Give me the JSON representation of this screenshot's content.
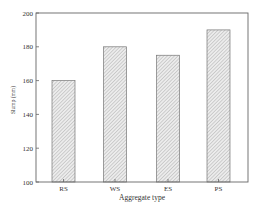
{
  "chart_data": {
    "type": "bar",
    "title": "",
    "xlabel": "Aggregate type",
    "ylabel": "Slump (mm)",
    "categories": [
      "RS",
      "WS",
      "ES",
      "PS"
    ],
    "values": [
      160,
      180,
      175,
      190
    ],
    "ylim": [
      100,
      200
    ],
    "yticks": [
      100,
      120,
      140,
      160,
      180,
      200
    ],
    "grid": false,
    "legend": null,
    "bar_style": "hatched"
  },
  "colors": {
    "axis": "#666666",
    "bar_fill": "#e4e4e4",
    "bar_hatch": "#aaaaaa",
    "bar_edge": "#777777"
  }
}
